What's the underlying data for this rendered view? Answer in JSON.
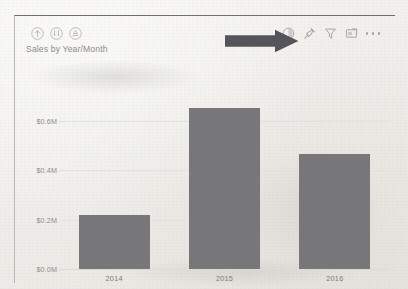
{
  "visual": {
    "title": "Sales by Year/Month",
    "drill_controls": [
      {
        "name": "drill-up-icon",
        "label": "Drill up"
      },
      {
        "name": "drill-down-icon",
        "label": "Drill down"
      },
      {
        "name": "expand-all-down-icon",
        "label": "Expand all down one level in the hierarchy"
      }
    ],
    "commands": [
      {
        "name": "spotlight-icon",
        "label": "Spotlight"
      },
      {
        "name": "pin-icon",
        "label": "Pin visual"
      },
      {
        "name": "filter-icon",
        "label": "Filters"
      },
      {
        "name": "focus-mode-icon",
        "label": "Focus mode"
      },
      {
        "name": "more-options-icon",
        "label": "More options"
      }
    ],
    "annotation": {
      "name": "pointer-arrow",
      "target": "spotlight-icon",
      "color": "#54545a",
      "direction": "right"
    }
  },
  "chart_data": {
    "type": "bar",
    "title": "Sales by Year/Month",
    "xlabel": "",
    "ylabel": "",
    "categories": [
      "2014",
      "2015",
      "2016"
    ],
    "values": [
      0.22,
      0.65,
      0.465
    ],
    "value_unit": "$M",
    "ylim": [
      0,
      0.7
    ],
    "yticks": [
      0.0,
      0.2,
      0.4,
      0.6
    ],
    "ytick_labels": [
      "$0.0M",
      "$0.2M",
      "$0.4M",
      "$0.6M"
    ],
    "grid": true,
    "legend": false,
    "series_color": "#77777a"
  }
}
